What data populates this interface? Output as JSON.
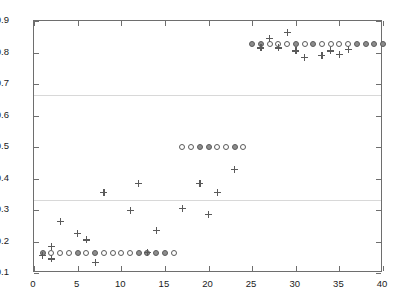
{
  "chart_data": {
    "type": "scatter",
    "title": "",
    "xlabel": "",
    "ylabel": "",
    "xlim": [
      0,
      40
    ],
    "ylim": [
      0.1,
      0.9
    ],
    "xticks": [
      0,
      5,
      10,
      15,
      20,
      25,
      30,
      35,
      40
    ],
    "xticklabels": [
      "0",
      "5",
      "10",
      "15",
      "20",
      "25",
      "30",
      "35",
      "40"
    ],
    "yticks": [
      0.1,
      0.2,
      0.3,
      0.4,
      0.5,
      0.6,
      0.7,
      0.8,
      0.9
    ],
    "yticklabels": [
      "0.1",
      "0.2",
      "0.3",
      "0.4",
      "0.5",
      "0.6",
      "0.7",
      "0.8",
      "0.9"
    ],
    "grid": false,
    "hlines": [
      0.665,
      0.333
    ],
    "hline_color": "#d8d8d8",
    "legend": null,
    "marker_colors": {
      "circle_open_edge": "#5a5a5a",
      "circle_filled_face": "#8d8d8d",
      "plus": "#5a5a5a"
    },
    "series": [
      {
        "name": "open-circle",
        "marker": "o",
        "fill": "none",
        "points": [
          [
            2,
            0.165
          ],
          [
            3,
            0.165
          ],
          [
            4,
            0.165
          ],
          [
            6,
            0.165
          ],
          [
            8,
            0.165
          ],
          [
            9,
            0.165
          ],
          [
            10,
            0.165
          ],
          [
            11,
            0.165
          ],
          [
            16,
            0.165
          ],
          [
            17,
            0.5
          ],
          [
            18,
            0.5
          ],
          [
            21,
            0.5
          ],
          [
            22,
            0.5
          ],
          [
            24,
            0.5
          ],
          [
            27,
            0.828
          ],
          [
            28,
            0.828
          ],
          [
            29,
            0.828
          ],
          [
            31,
            0.828
          ],
          [
            33,
            0.828
          ],
          [
            34,
            0.828
          ],
          [
            35,
            0.828
          ],
          [
            36,
            0.828
          ]
        ]
      },
      {
        "name": "filled-circle",
        "marker": "o",
        "fill": "solid",
        "points": [
          [
            1,
            0.165
          ],
          [
            5,
            0.165
          ],
          [
            7,
            0.165
          ],
          [
            12,
            0.165
          ],
          [
            13,
            0.165
          ],
          [
            14,
            0.165
          ],
          [
            15,
            0.165
          ],
          [
            19,
            0.5
          ],
          [
            20,
            0.5
          ],
          [
            23,
            0.5
          ],
          [
            25,
            0.828
          ],
          [
            26,
            0.828
          ],
          [
            30,
            0.828
          ],
          [
            32,
            0.828
          ],
          [
            37,
            0.828
          ],
          [
            38,
            0.828
          ],
          [
            39,
            0.828
          ],
          [
            40,
            0.828
          ]
        ]
      },
      {
        "name": "plus",
        "marker": "+",
        "fill": "none",
        "points": [
          [
            1,
            0.155
          ],
          [
            2,
            0.185
          ],
          [
            2,
            0.145
          ],
          [
            3,
            0.265
          ],
          [
            5,
            0.225
          ],
          [
            6,
            0.205
          ],
          [
            7,
            0.135
          ],
          [
            8,
            0.355
          ],
          [
            11,
            0.3
          ],
          [
            12,
            0.385
          ],
          [
            13,
            0.165
          ],
          [
            14,
            0.235
          ],
          [
            17,
            0.305
          ],
          [
            19,
            0.385
          ],
          [
            20,
            0.285
          ],
          [
            21,
            0.355
          ],
          [
            23,
            0.43
          ],
          [
            27,
            0.845
          ],
          [
            29,
            0.865
          ],
          [
            26,
            0.815
          ],
          [
            28,
            0.815
          ],
          [
            30,
            0.805
          ],
          [
            31,
            0.785
          ],
          [
            33,
            0.79
          ],
          [
            34,
            0.805
          ],
          [
            35,
            0.795
          ],
          [
            36,
            0.81
          ]
        ]
      }
    ]
  }
}
